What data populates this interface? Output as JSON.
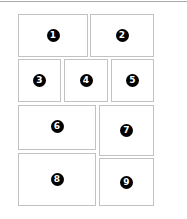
{
  "layout": {
    "panels": [
      {
        "label": "1",
        "x": 18,
        "y": 14,
        "w": 70,
        "h": 43
      },
      {
        "label": "2",
        "x": 90,
        "y": 14,
        "w": 64,
        "h": 43
      },
      {
        "label": "3",
        "x": 18,
        "y": 59,
        "w": 43,
        "h": 43
      },
      {
        "label": "4",
        "x": 64,
        "y": 59,
        "w": 44,
        "h": 43
      },
      {
        "label": "5",
        "x": 111,
        "y": 59,
        "w": 43,
        "h": 43
      },
      {
        "label": "6",
        "x": 18,
        "y": 105,
        "w": 78,
        "h": 45
      },
      {
        "label": "7",
        "x": 99,
        "y": 105,
        "w": 55,
        "h": 51
      },
      {
        "label": "8",
        "x": 18,
        "y": 153,
        "w": 78,
        "h": 53
      },
      {
        "label": "9",
        "x": 99,
        "y": 158,
        "w": 55,
        "h": 48
      }
    ]
  }
}
